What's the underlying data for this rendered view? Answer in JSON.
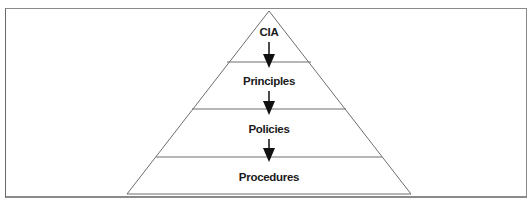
{
  "caption": {
    "text": "Figure",
    "visible": "cut-off at top edge"
  },
  "diagram": {
    "type": "pyramid",
    "direction": "top-down",
    "tiers": [
      {
        "label": "CIA",
        "level": 1
      },
      {
        "label": "Principles",
        "level": 2
      },
      {
        "label": "Policies",
        "level": 3
      },
      {
        "label": "Procedures",
        "level": 4
      }
    ],
    "arrows": [
      {
        "from": "CIA",
        "to": "Principles",
        "icon": "arrow-down-icon"
      },
      {
        "from": "Principles",
        "to": "Policies",
        "icon": "arrow-down-icon"
      },
      {
        "from": "Policies",
        "to": "Procedures",
        "icon": "arrow-down-icon"
      }
    ],
    "colors": {
      "line": "#6e6e6e",
      "text": "#1a1a1a",
      "arrow": "#111111",
      "background": "#ffffff"
    }
  }
}
